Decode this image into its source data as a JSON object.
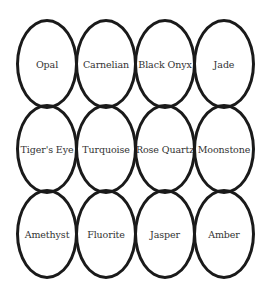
{
  "diagram": {
    "type": "ellipse-grid",
    "rows": 3,
    "columns": 4,
    "stroke_color": "#1a1a1a",
    "text_color": "#333333",
    "background": "#ffffff",
    "items": [
      {
        "label": "Opal"
      },
      {
        "label": "Carnelian"
      },
      {
        "label": "Black Onyx"
      },
      {
        "label": "Jade"
      },
      {
        "label": "Tiger's Eye"
      },
      {
        "label": "Turquoise"
      },
      {
        "label": "Rose Quartz"
      },
      {
        "label": "Moonstone"
      },
      {
        "label": "Amethyst"
      },
      {
        "label": "Fluorite"
      },
      {
        "label": "Jasper"
      },
      {
        "label": "Amber"
      }
    ]
  }
}
